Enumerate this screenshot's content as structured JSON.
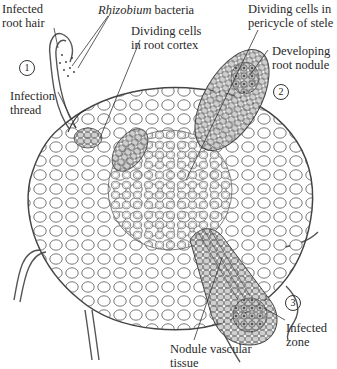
{
  "diagram": {
    "type": "botanical cross-section",
    "colors": {
      "outline": "#444444",
      "nodule_fill": "#c8c8c8",
      "infected_cell_fill": "#9a9a9a",
      "background": "#ffffff"
    }
  },
  "labels": {
    "infected_root_hair": "Infected\nroot hair",
    "rhizobium_italic": "Rhizobium",
    "rhizobium_rest": " bacteria",
    "dividing_cortex": "Dividing cells\nin root cortex",
    "dividing_pericycle": "Dividing cells in\npericycle of stele",
    "developing_nodule": "Developing\nroot nodule",
    "infection_thread": "Infection\nthread",
    "nodule_vascular": "Nodule vascular\ntissue",
    "infected_zone": "Infected\nzone"
  },
  "stages": [
    "1",
    "2",
    "3"
  ]
}
